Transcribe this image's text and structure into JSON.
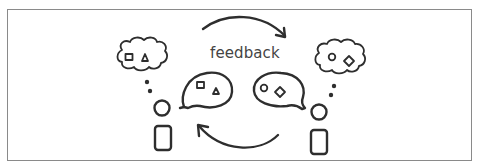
{
  "diagram": {
    "type": "feedback-loop-illustration",
    "label": "feedback",
    "stroke_color": "#2e2e2e",
    "frame_color": "#8a8a8a",
    "left_person": {
      "thought_bubble_shapes": [
        "square",
        "triangle"
      ],
      "speech_bubble_shapes": [
        "square",
        "triangle"
      ]
    },
    "right_person": {
      "thought_bubble_shapes": [
        "circle",
        "diamond"
      ],
      "speech_bubble_shapes": [
        "circle",
        "diamond"
      ]
    },
    "arrows": [
      {
        "direction": "left-to-right",
        "position": "top"
      },
      {
        "direction": "right-to-left",
        "position": "bottom"
      }
    ]
  }
}
